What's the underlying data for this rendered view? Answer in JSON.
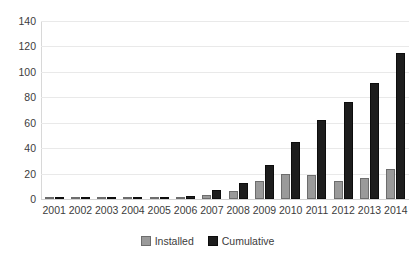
{
  "chart_data": {
    "type": "bar",
    "title": "",
    "subtitle": "",
    "xlabel": "",
    "ylabel": "",
    "ylim": [
      0,
      140
    ],
    "yticks": [
      0,
      20,
      40,
      60,
      80,
      100,
      120,
      140
    ],
    "grid": true,
    "legend_position": "bottom-center",
    "categories": [
      "2001",
      "2002",
      "2003",
      "2004",
      "2005",
      "2006",
      "2007",
      "2008",
      "2009",
      "2010",
      "2011",
      "2012",
      "2013",
      "2014"
    ],
    "series": [
      {
        "name": "Installed",
        "color": "#9a9a9a",
        "values": [
          0.2,
          0.2,
          0.2,
          0.3,
          0.5,
          1.2,
          3.5,
          6.5,
          14.5,
          19.5,
          18.5,
          13.8,
          16.5,
          23.8
        ]
      },
      {
        "name": "Cumulative",
        "color": "#1d1d1d",
        "values": [
          0.2,
          0.4,
          0.6,
          0.9,
          1.4,
          2.6,
          7.0,
          12.8,
          27.0,
          44.5,
          62.5,
          76.0,
          91.5,
          115.0
        ]
      }
    ]
  },
  "legend": {
    "items": [
      {
        "label": "Installed"
      },
      {
        "label": "Cumulative"
      }
    ]
  }
}
